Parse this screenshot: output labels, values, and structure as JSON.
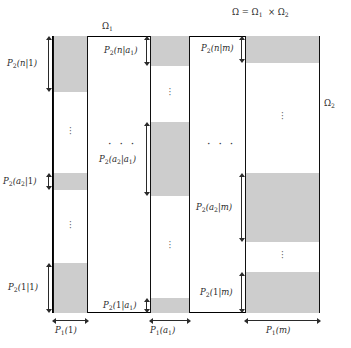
{
  "figure": {
    "title_product_space": "Ω = Ω₁ × Ω₂",
    "label_omega1": "Ω₁",
    "label_omega2": "Ω₂",
    "colors": {
      "band_fill": "#cdcdcd",
      "stroke": "#111111",
      "text": "#2b2b2b",
      "background": "#ffffff"
    },
    "ellipsis_horizontal": "· · ·",
    "ellipsis_vertical": "⋮"
  },
  "chart_data": {
    "type": "diagram",
    "xlabel": "Ω₁",
    "ylabel": "Ω₂",
    "columns": [
      {
        "id": "col-1",
        "width_label": "P₁(1)",
        "x": 53,
        "width": 35,
        "bands": [
          {
            "id": "band-n-1",
            "label": "P₂(n|1)",
            "top": 36,
            "height": 56,
            "shaded": true
          },
          {
            "id": "gap-1a",
            "label": "",
            "top": 92,
            "height": 81,
            "shaded": false,
            "vdots": true
          },
          {
            "id": "band-a2-1",
            "label": "P₂(a₂|1)",
            "top": 173,
            "height": 17,
            "shaded": true
          },
          {
            "id": "gap-1b",
            "label": "",
            "top": 190,
            "height": 73,
            "shaded": false,
            "vdots": true
          },
          {
            "id": "band-1-1",
            "label": "P₂(1|1)",
            "top": 263,
            "height": 50,
            "shaded": true
          }
        ]
      },
      {
        "id": "col-2",
        "width_label": "P₁(a₁)",
        "x": 150,
        "width": 40,
        "bands": [
          {
            "id": "band-n-a1",
            "label": "P₂(n|a₁)",
            "top": 36,
            "height": 30,
            "shaded": true
          },
          {
            "id": "gap-2a",
            "label": "",
            "top": 66,
            "height": 56,
            "shaded": false,
            "vdots": true
          },
          {
            "id": "band-a2-a1",
            "label": "P₂(a₂|a₁)",
            "top": 122,
            "height": 74,
            "shaded": true
          },
          {
            "id": "gap-2b",
            "label": "",
            "top": 196,
            "height": 102,
            "shaded": false,
            "vdots": true
          },
          {
            "id": "band-1-a1",
            "label": "P₂(1|a₁)",
            "top": 298,
            "height": 15,
            "shaded": true
          }
        ]
      },
      {
        "id": "col-3",
        "width_label": "P₁(m)",
        "x": 245,
        "width": 75,
        "bands": [
          {
            "id": "band-n-m",
            "label": "P₂(n|m)",
            "top": 36,
            "height": 27,
            "shaded": true
          },
          {
            "id": "gap-3a",
            "label": "",
            "top": 63,
            "height": 110,
            "shaded": false,
            "vdots": true
          },
          {
            "id": "band-a2-m",
            "label": "P₂(a₂|m)",
            "top": 173,
            "height": 69,
            "shaded": true
          },
          {
            "id": "gap-3b",
            "label": "",
            "top": 242,
            "height": 30,
            "shaded": false,
            "vdots": true
          },
          {
            "id": "band-1-m",
            "label": "P₂(1|m)",
            "top": 272,
            "height": 41,
            "shaded": true
          }
        ]
      }
    ],
    "outer_box": {
      "x": 52,
      "y": 36,
      "width": 268,
      "height": 277
    },
    "annotations": [
      {
        "id": "omega-product",
        "text": "Ω = Ω₁ × Ω₂",
        "x": 232,
        "y": 8
      },
      {
        "id": "omega-1",
        "text": "Ω₁",
        "x": 103,
        "y": 22
      },
      {
        "id": "omega-2",
        "text": "Ω₂",
        "x": 324,
        "y": 100
      }
    ]
  },
  "labels": {
    "col1": {
      "band_n": {
        "P": "P",
        "Psub": "2",
        "arg": "(n|1)"
      },
      "band_a2": {
        "P": "P",
        "Psub": "2",
        "arg_pre": "(a",
        "arg_sub": "2",
        "arg_post": "|1)"
      },
      "band_1": {
        "P": "P",
        "Psub": "2",
        "arg": "(1|1)"
      },
      "width": {
        "P": "P",
        "Psub": "1",
        "arg": "(1)"
      }
    },
    "col2": {
      "band_n": {
        "P": "P",
        "Psub": "2",
        "arg_pre": "(n|a",
        "arg_sub": "1",
        "arg_post": ")"
      },
      "band_a2": {
        "P": "P",
        "Psub": "2",
        "arg_pre": "(a",
        "arg_sub": "2",
        "arg_mid": "|a",
        "arg_sub2": "1",
        "arg_post": ")"
      },
      "band_1": {
        "P": "P",
        "Psub": "2",
        "arg_pre": "(1|a",
        "arg_sub": "1",
        "arg_post": ")"
      },
      "width": {
        "P": "P",
        "Psub": "1",
        "arg_pre": "(a",
        "arg_sub": "1",
        "arg_post": ")"
      }
    },
    "col3": {
      "band_n": {
        "P": "P",
        "Psub": "2",
        "arg": "(n|m)"
      },
      "band_a2": {
        "P": "P",
        "Psub": "2",
        "arg_pre": "(a",
        "arg_sub": "2",
        "arg_post": "|m)"
      },
      "band_1": {
        "P": "P",
        "Psub": "2",
        "arg": "(1|m)"
      },
      "width": {
        "P": "P",
        "Psub": "1",
        "arg": "(m)"
      }
    }
  }
}
